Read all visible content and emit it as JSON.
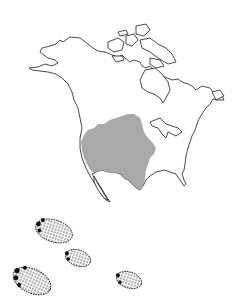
{
  "map": {
    "region": "North America",
    "outline_color": "#1a1a1a",
    "land_fill": "#ffffff",
    "range_fill": "#a9a9a9",
    "range_label": "shaded range (central & southwestern North America)"
  },
  "tracks": {
    "count": 4,
    "color": "#111111",
    "items": [
      {
        "cx": 54,
        "cy": 231,
        "rx": 19,
        "ry": 11,
        "rot": 18
      },
      {
        "cx": 78,
        "cy": 258,
        "rx": 13,
        "ry": 8,
        "rot": 18
      },
      {
        "cx": 32,
        "cy": 281,
        "rx": 20,
        "ry": 12,
        "rot": 25
      },
      {
        "cx": 129,
        "cy": 280,
        "rx": 13,
        "ry": 8,
        "rot": 18
      }
    ]
  }
}
